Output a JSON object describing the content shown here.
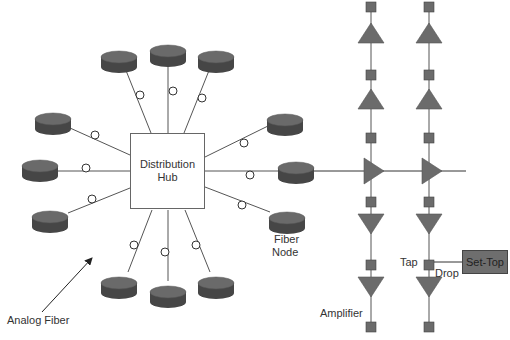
{
  "diagram": {
    "hub": {
      "line1": "Distribution",
      "line2": "Hub",
      "x": 130,
      "y": 133,
      "w": 75,
      "h": 76
    },
    "labels": {
      "analog_fiber": "Analog Fiber",
      "fiber_node_line1": "Fiber",
      "fiber_node_line2": "Node",
      "tap": "Tap",
      "drop": "Drop",
      "amplifier": "Amplifier",
      "set_top": "Set-Top"
    },
    "colors": {
      "puck_top": "#6a6a6a",
      "puck_side": "#464646",
      "amp_fill": "#6b6b6b",
      "tap_fill": "#6b6b6b",
      "line": "#555555",
      "settop_fill": "#6e6e6e"
    },
    "fiber_nodes": [
      {
        "id": "n-top-left",
        "cx": 53,
        "cy": 119,
        "lx1": 70,
        "ly1": 128,
        "lx2": 130,
        "ly2": 155,
        "ox": 95,
        "oy": 135
      },
      {
        "id": "n-left",
        "cx": 40,
        "cy": 166,
        "lx1": 58,
        "ly1": 171,
        "lx2": 130,
        "ly2": 171,
        "ox": 86,
        "oy": 168
      },
      {
        "id": "n-bottom-left",
        "cx": 50,
        "cy": 217,
        "lx1": 68,
        "ly1": 213,
        "lx2": 130,
        "ly2": 188,
        "ox": 92,
        "oy": 199
      },
      {
        "id": "n-top-1",
        "cx": 119,
        "cy": 57,
        "lx1": 125,
        "ly1": 68,
        "lx2": 151,
        "ly2": 133,
        "ox": 140,
        "oy": 95
      },
      {
        "id": "n-top-2",
        "cx": 168,
        "cy": 51,
        "lx1": 168,
        "ly1": 62,
        "lx2": 168,
        "ly2": 133,
        "ox": 173,
        "oy": 91
      },
      {
        "id": "n-top-3",
        "cx": 216,
        "cy": 57,
        "lx1": 210,
        "ly1": 68,
        "lx2": 184,
        "ly2": 133,
        "ox": 202,
        "oy": 98
      },
      {
        "id": "n-right-top",
        "cx": 285,
        "cy": 120,
        "lx1": 268,
        "ly1": 126,
        "lx2": 205,
        "ly2": 157,
        "ox": 244,
        "oy": 143
      },
      {
        "id": "n-right",
        "cx": 296,
        "cy": 168,
        "lx1": 278,
        "ly1": 171,
        "lx2": 205,
        "ly2": 171,
        "ox": 250,
        "oy": 175
      },
      {
        "id": "n-right-bottom",
        "cx": 287,
        "cy": 218,
        "lx1": 270,
        "ly1": 212,
        "lx2": 205,
        "ly2": 187,
        "ox": 242,
        "oy": 205
      },
      {
        "id": "n-bottom-1",
        "cx": 119,
        "cy": 283,
        "lx1": 128,
        "ly1": 272,
        "lx2": 152,
        "ly2": 210,
        "ox": 134,
        "oy": 245
      },
      {
        "id": "n-bottom-2",
        "cx": 168,
        "cy": 292,
        "lx1": 168,
        "ly1": 281,
        "lx2": 168,
        "ly2": 210,
        "ox": 165,
        "oy": 252
      },
      {
        "id": "n-bottom-3",
        "cx": 216,
        "cy": 283,
        "lx1": 210,
        "ly1": 272,
        "lx2": 185,
        "ly2": 210,
        "ox": 196,
        "oy": 245
      }
    ],
    "trunk": {
      "x1": 314,
      "y1": 171,
      "x2": 466,
      "y2": 171
    },
    "columns": [
      {
        "x": 371,
        "taps_y": [
          7,
          75,
          138,
          202,
          265,
          327
        ],
        "amps_up_y": [
          33,
          99
        ],
        "amps_down_y": [
          224,
          287
        ],
        "amp_right_y": 171
      },
      {
        "x": 429,
        "taps_y": [
          7,
          75,
          138,
          202,
          265,
          327
        ],
        "amps_up_y": [
          33,
          99
        ],
        "amps_down_y": [
          224,
          287
        ],
        "amp_right_y": 171
      }
    ],
    "drop_line": {
      "x1": 434,
      "y1": 262,
      "x2": 462,
      "y2": 262
    },
    "analog_fiber_arrow": {
      "x1": 42,
      "y1": 312,
      "x2": 92,
      "y2": 258
    }
  }
}
